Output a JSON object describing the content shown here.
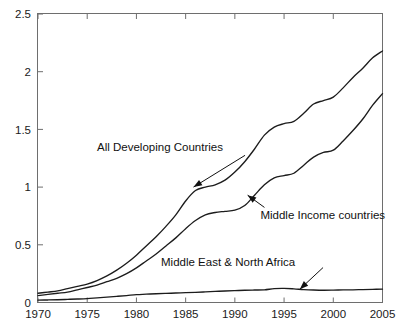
{
  "chart_data": {
    "type": "line",
    "title": "",
    "subtitle": "",
    "xlabel": "",
    "ylabel": "",
    "xlim": [
      1970,
      2005
    ],
    "ylim": [
      0,
      2.5
    ],
    "grid": false,
    "legend_position": "none (inline annotations with leader arrows)",
    "x_ticks": [
      1970,
      1975,
      1980,
      1985,
      1990,
      1995,
      2000,
      2005
    ],
    "x_tick_labels": [
      "1970",
      "1975",
      "1980",
      "1985",
      "1990",
      "1995",
      "2000",
      "2005"
    ],
    "y_ticks": [
      0,
      0.5,
      1,
      1.5,
      2,
      2.5
    ],
    "y_tick_labels": [
      "0",
      "0.5",
      "1",
      "1.5",
      "2",
      "2.5"
    ],
    "x": [
      1970,
      1971,
      1972,
      1973,
      1974,
      1975,
      1976,
      1977,
      1978,
      1979,
      1980,
      1981,
      1982,
      1983,
      1984,
      1985,
      1986,
      1987,
      1988,
      1989,
      1990,
      1991,
      1992,
      1993,
      1994,
      1995,
      1996,
      1997,
      1998,
      1999,
      2000,
      2001,
      2002,
      2003,
      2004,
      2005
    ],
    "series": [
      {
        "name": "All Developing Countries",
        "label_x": 1976.0,
        "label_y": 1.31,
        "arrow_to_x": 1985.8,
        "arrow_to_y": 1.0,
        "values": [
          0.08,
          0.09,
          0.1,
          0.12,
          0.14,
          0.16,
          0.19,
          0.23,
          0.28,
          0.34,
          0.41,
          0.49,
          0.57,
          0.66,
          0.76,
          0.88,
          0.97,
          1.0,
          1.02,
          1.06,
          1.13,
          1.22,
          1.33,
          1.45,
          1.52,
          1.55,
          1.57,
          1.64,
          1.72,
          1.75,
          1.78,
          1.86,
          1.95,
          2.03,
          2.12,
          2.18
        ]
      },
      {
        "name": "Middle Income countries",
        "label_x": 1992.6,
        "label_y": 0.72,
        "arrow_to_x": 1991.3,
        "arrow_to_y": 0.93,
        "values": [
          0.06,
          0.07,
          0.08,
          0.09,
          0.11,
          0.13,
          0.15,
          0.18,
          0.21,
          0.25,
          0.3,
          0.36,
          0.42,
          0.49,
          0.56,
          0.64,
          0.71,
          0.76,
          0.78,
          0.79,
          0.8,
          0.84,
          0.93,
          1.02,
          1.08,
          1.1,
          1.12,
          1.19,
          1.26,
          1.3,
          1.32,
          1.4,
          1.49,
          1.59,
          1.71,
          1.81
        ]
      },
      {
        "name": "Middle East & North Africa",
        "label_x": 1982.5,
        "label_y": 0.32,
        "arrow_to_x": 1996.6,
        "arrow_to_y": 0.115,
        "values": [
          0.02,
          0.022,
          0.024,
          0.027,
          0.03,
          0.034,
          0.04,
          0.046,
          0.053,
          0.06,
          0.068,
          0.072,
          0.076,
          0.079,
          0.082,
          0.085,
          0.088,
          0.092,
          0.096,
          0.1,
          0.103,
          0.106,
          0.108,
          0.11,
          0.12,
          0.122,
          0.118,
          0.112,
          0.108,
          0.106,
          0.107,
          0.109,
          0.11,
          0.112,
          0.114,
          0.116
        ]
      }
    ]
  },
  "axes": {
    "frame_color": "#6e6e6e",
    "line_color": "#1c1c1c",
    "background": "#ffffff"
  }
}
